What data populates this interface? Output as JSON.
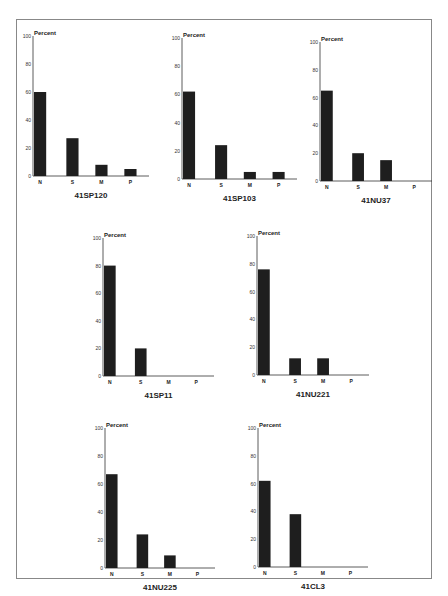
{
  "chart_data": [
    {
      "type": "bar",
      "title": "41SP120",
      "ylabel": "Percent",
      "xlabel": "",
      "categories": [
        "N",
        "S",
        "M",
        "P"
      ],
      "values": [
        60,
        27,
        8,
        5
      ],
      "yticks": [
        0,
        20,
        40,
        60,
        80,
        100
      ],
      "ylim": [
        0,
        100
      ],
      "grid": false,
      "bar_color": "#1e1e1e"
    },
    {
      "type": "bar",
      "title": "41SP103",
      "ylabel": "Percent",
      "xlabel": "",
      "categories": [
        "N",
        "S",
        "M",
        "P"
      ],
      "values": [
        62,
        24,
        5,
        5
      ],
      "yticks": [
        0,
        20,
        40,
        60,
        80,
        100
      ],
      "ylim": [
        0,
        100
      ],
      "grid": false,
      "bar_color": "#1e1e1e"
    },
    {
      "type": "bar",
      "title": "41NU37",
      "ylabel": "Percent",
      "xlabel": "",
      "categories": [
        "N",
        "S",
        "M",
        "P"
      ],
      "values": [
        65,
        20,
        15,
        0
      ],
      "yticks": [
        0,
        20,
        40,
        60,
        80,
        100
      ],
      "ylim": [
        0,
        100
      ],
      "grid": false,
      "bar_color": "#1e1e1e"
    },
    {
      "type": "bar",
      "title": "41SP11",
      "ylabel": "Percent",
      "xlabel": "",
      "categories": [
        "N",
        "S",
        "M",
        "P"
      ],
      "values": [
        80,
        20,
        0,
        0
      ],
      "yticks": [
        0,
        20,
        40,
        60,
        80,
        100
      ],
      "ylim": [
        0,
        100
      ],
      "grid": false,
      "bar_color": "#1e1e1e"
    },
    {
      "type": "bar",
      "title": "41NU221",
      "ylabel": "Percent",
      "xlabel": "",
      "categories": [
        "N",
        "S",
        "M",
        "P"
      ],
      "values": [
        76,
        12,
        12,
        0
      ],
      "yticks": [
        0,
        20,
        40,
        60,
        80,
        100
      ],
      "ylim": [
        0,
        100
      ],
      "grid": false,
      "bar_color": "#1e1e1e"
    },
    {
      "type": "bar",
      "title": "41NU225",
      "ylabel": "Percent",
      "xlabel": "",
      "categories": [
        "N",
        "S",
        "M",
        "P"
      ],
      "values": [
        67,
        24,
        9,
        0
      ],
      "yticks": [
        0,
        20,
        40,
        60,
        80,
        100
      ],
      "ylim": [
        0,
        100
      ],
      "grid": false,
      "bar_color": "#1e1e1e"
    },
    {
      "type": "bar",
      "title": "41CL3",
      "ylabel": "Percent",
      "xlabel": "",
      "categories": [
        "N",
        "S",
        "M",
        "P"
      ],
      "values": [
        62,
        38,
        0,
        0
      ],
      "yticks": [
        0,
        20,
        40,
        60,
        80,
        100
      ],
      "ylim": [
        0,
        100
      ],
      "grid": false,
      "bar_color": "#1e1e1e"
    }
  ],
  "layout": {
    "positions": [
      {
        "left": 33,
        "top": 28,
        "plotW": 116,
        "plotH": 140
      },
      {
        "left": 182,
        "top": 30,
        "plotW": 115,
        "plotH": 141
      },
      {
        "left": 320,
        "top": 34,
        "plotW": 112,
        "plotH": 139
      },
      {
        "left": 103,
        "top": 230,
        "plotW": 111,
        "plotH": 138
      },
      {
        "left": 257,
        "top": 228,
        "plotW": 112,
        "plotH": 139
      },
      {
        "left": 105,
        "top": 420,
        "plotW": 110,
        "plotH": 140
      },
      {
        "left": 258,
        "top": 420,
        "plotW": 110,
        "plotH": 139
      }
    ]
  }
}
